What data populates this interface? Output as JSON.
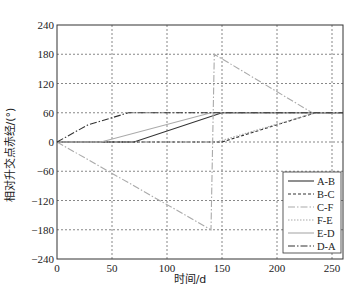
{
  "chart_data": {
    "type": "line",
    "title": "",
    "xlabel": "时间/d",
    "ylabel": "相对升交点赤经/(°)",
    "xlim": [
      0,
      260
    ],
    "ylim": [
      -240,
      240
    ],
    "xticks": [
      0,
      50,
      100,
      150,
      200,
      250
    ],
    "yticks": [
      -240,
      -180,
      -120,
      -60,
      0,
      60,
      120,
      180,
      240
    ],
    "xtick_labels": [
      "0",
      "50",
      "100",
      "150",
      "200",
      "250"
    ],
    "ytick_labels": [
      "−240",
      "−180",
      "−120",
      "−60",
      "0",
      "60",
      "120",
      "180",
      "240"
    ],
    "grid": true,
    "legend_position": "lower right",
    "series": [
      {
        "name": "A-B",
        "style": "solid",
        "color": "#333333",
        "x": [
          0,
          70,
          150,
          260
        ],
        "y": [
          0,
          0,
          60,
          60
        ]
      },
      {
        "name": "B-C",
        "style": "dashed",
        "color": "#333333",
        "x": [
          0,
          150,
          235,
          260
        ],
        "y": [
          0,
          0,
          60,
          60
        ]
      },
      {
        "name": "C-F",
        "style": "dashdot",
        "color": "#aaaaaa",
        "x": [
          0,
          140,
          140,
          143,
          232,
          260
        ],
        "y": [
          0,
          -180,
          -180,
          180,
          60,
          60
        ]
      },
      {
        "name": "F-E",
        "style": "dotted",
        "color": "#aaaaaa",
        "x": [
          0,
          145,
          235,
          260
        ],
        "y": [
          0,
          0,
          60,
          60
        ]
      },
      {
        "name": "E-D",
        "style": "solid",
        "color": "#aaaaaa",
        "x": [
          0,
          40,
          140,
          260
        ],
        "y": [
          0,
          0,
          60,
          60
        ]
      },
      {
        "name": "D-A",
        "style": "dashdot",
        "color": "#333333",
        "x": [
          0,
          28,
          65,
          260
        ],
        "y": [
          0,
          35,
          60,
          60
        ]
      }
    ]
  },
  "legend": {
    "items": [
      "A-B",
      "B-C",
      "C-F",
      "F-E",
      "E-D",
      "D-A"
    ]
  },
  "axes": {
    "xlabel": "时间/d",
    "ylabel": "相对升交点赤经/(°)"
  }
}
